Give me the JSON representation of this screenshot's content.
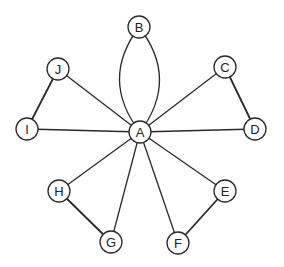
{
  "graph": {
    "node_radius": 11,
    "colors": {
      "stroke": "#2a2a2a",
      "fill": "#ffffff",
      "text": "#222222"
    },
    "nodes": [
      {
        "id": "A",
        "label": "A",
        "x": 140,
        "y": 132
      },
      {
        "id": "B",
        "label": "B",
        "x": 139,
        "y": 27
      },
      {
        "id": "C",
        "label": "C",
        "x": 225,
        "y": 67
      },
      {
        "id": "D",
        "label": "D",
        "x": 255,
        "y": 129
      },
      {
        "id": "E",
        "label": "E",
        "x": 225,
        "y": 191
      },
      {
        "id": "F",
        "label": "F",
        "x": 178,
        "y": 243
      },
      {
        "id": "G",
        "label": "G",
        "x": 111,
        "y": 242
      },
      {
        "id": "H",
        "label": "H",
        "x": 59,
        "y": 191
      },
      {
        "id": "I",
        "label": "I",
        "x": 27,
        "y": 129
      },
      {
        "id": "J",
        "label": "J",
        "x": 58,
        "y": 69
      }
    ],
    "edges": [
      {
        "from": "A",
        "to": "B",
        "curve": -20
      },
      {
        "from": "A",
        "to": "B",
        "curve": 20
      },
      {
        "from": "A",
        "to": "C"
      },
      {
        "from": "A",
        "to": "D"
      },
      {
        "from": "A",
        "to": "E"
      },
      {
        "from": "A",
        "to": "F"
      },
      {
        "from": "A",
        "to": "G"
      },
      {
        "from": "A",
        "to": "H"
      },
      {
        "from": "A",
        "to": "I"
      },
      {
        "from": "A",
        "to": "J"
      },
      {
        "from": "C",
        "to": "D",
        "thick": true
      },
      {
        "from": "E",
        "to": "F",
        "thick": true
      },
      {
        "from": "G",
        "to": "H",
        "thick": true
      },
      {
        "from": "I",
        "to": "J",
        "thick": true
      }
    ]
  }
}
